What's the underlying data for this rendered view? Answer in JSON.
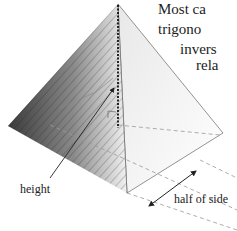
{
  "diagram": {
    "labels": {
      "height": "height",
      "half_side": "half of side"
    }
  },
  "body_text": {
    "lines": [
      "Most ca",
      "trigono",
      "invers",
      "rela"
    ]
  },
  "colors": {
    "line": "#555555",
    "dash": "#999999",
    "stone_dark": "#3a3a3a",
    "stone_light": "#d8d8d8",
    "face": "#eeeeee"
  }
}
